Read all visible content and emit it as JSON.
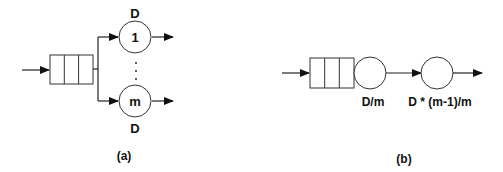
{
  "diagram_a": {
    "caption": "(a)",
    "server_top": {
      "label": "1",
      "service_label": "D"
    },
    "server_bottom": {
      "label": "m",
      "service_label": "D"
    },
    "ellipsis": "⋮",
    "queue_cells": 3
  },
  "diagram_b": {
    "caption": "(b)",
    "stage1": {
      "service_label": "D/m"
    },
    "stage2": {
      "service_label": "D * (m-1)/m"
    },
    "queue_cells": 3
  },
  "colors": {
    "stroke": "#222222",
    "background": "#ffffff"
  }
}
